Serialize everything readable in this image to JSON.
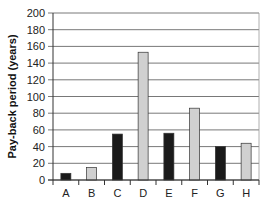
{
  "chart_data": {
    "type": "bar",
    "title": "",
    "xlabel": "",
    "ylabel": "Pay-back period (years)",
    "ylim": [
      0,
      200
    ],
    "yticks": [
      0,
      20,
      40,
      60,
      80,
      100,
      120,
      140,
      160,
      180,
      200
    ],
    "grid": true,
    "legend": null,
    "categories": [
      "A",
      "B",
      "C",
      "D",
      "E",
      "F",
      "G",
      "H"
    ],
    "values": [
      8,
      15,
      55,
      153,
      56,
      86,
      40,
      44
    ],
    "bar_colors": [
      "#1a1a1a",
      "#d0d0d0",
      "#1a1a1a",
      "#d0d0d0",
      "#1a1a1a",
      "#d0d0d0",
      "#1a1a1a",
      "#d0d0d0"
    ]
  },
  "colors": {
    "dark_bar": "#1a1a1a",
    "light_bar": "#d0d0d0",
    "gridline": "#555555",
    "axis": "#333333"
  }
}
